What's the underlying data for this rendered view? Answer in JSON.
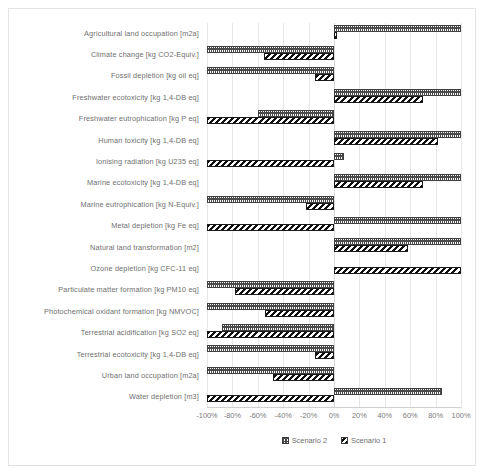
{
  "chart_data": {
    "type": "bar",
    "orientation": "horizontal",
    "title": "",
    "xlabel": "",
    "ylabel": "",
    "xlim": [
      -100,
      100
    ],
    "grid": true,
    "legend_position": "bottom",
    "tick_labels": [
      "-100%",
      "-80%",
      "-60%",
      "-40%",
      "-20%",
      "0%",
      "20%",
      "40%",
      "60%",
      "80%",
      "100%"
    ],
    "tick_values": [
      -100,
      -80,
      -60,
      -40,
      -20,
      0,
      20,
      40,
      60,
      80,
      100
    ],
    "categories": [
      "Agricultural land occupation [m2a]",
      "Climate change [kg CO2-Equiv.]",
      "Fossil depletion [kg oil eq]",
      "Freshwater ecotoxicity [kg 1,4-DB eq]",
      "Freshwater eutrophication [kg P eq]",
      "Human toxicity [kg 1,4-DB eq]",
      "Ionising radiation [kg U235 eq]",
      "Marine ecotoxicity [kg 1,4-DB eq]",
      "Marine eutrophication [kg N-Equiv.]",
      "Metal depletion [kg Fe eq]",
      "Natural land transformation [m2]",
      "Ozone depletion [kg CFC-11 eq]",
      "Particulate matter formation [kg PM10 eq]",
      "Photochemical oxidant formation [kg NMVOC]",
      "Terrestrial acidification [kg SO2 eq]",
      "Terrestrial ecotoxicity [kg 1,4-DB eq]",
      "Urban land occupation [m2a]",
      "Water depletion [m3]"
    ],
    "series": [
      {
        "name": "Scenario 2",
        "values": [
          100,
          -100,
          -100,
          100,
          -60,
          100,
          8,
          100,
          -100,
          100,
          100,
          0,
          -100,
          -100,
          -88,
          -100,
          -100,
          85
        ]
      },
      {
        "name": "Scenario 1",
        "values": [
          2,
          -55,
          -15,
          70,
          -100,
          82,
          -100,
          70,
          -22,
          -100,
          58,
          100,
          -78,
          -54,
          -100,
          -15,
          -48,
          -100
        ]
      }
    ]
  },
  "legend": {
    "items": [
      {
        "label": "Scenario 2",
        "pattern": "dotted"
      },
      {
        "label": "Scenario 1",
        "pattern": "diagonal-hatch"
      }
    ]
  },
  "colors": {
    "series1_fill": "#111111",
    "series2_fill": "#4a4a4a",
    "gridline": "#e6e6e6",
    "label_text": "#6f6f6f",
    "frame_border": "#e3e3e3"
  }
}
